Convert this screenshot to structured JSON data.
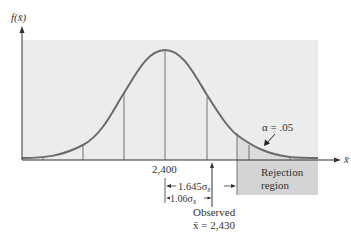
{
  "diagram": {
    "type": "normal-distribution-hypothesis-test",
    "y_axis_label": "f(x̄)",
    "x_axis_label": "x̄",
    "mean_label": "2,400",
    "alpha_label": "α = .05",
    "rejection_label_line1": "Rejection",
    "rejection_label_line2": "region",
    "critical_distance_label": "1.645σ",
    "critical_distance_sub": "x̄",
    "observed_distance_label": "1.06σ",
    "observed_distance_sub": "x̄",
    "observed_label_line1": "Observed",
    "observed_label_line2": "x̄ = 2,430",
    "colors": {
      "panel": "#ececec",
      "rejection_box": "#d4d4d4",
      "curve": "#6b6b6b",
      "lines": "#444444",
      "text": "#333333"
    }
  }
}
